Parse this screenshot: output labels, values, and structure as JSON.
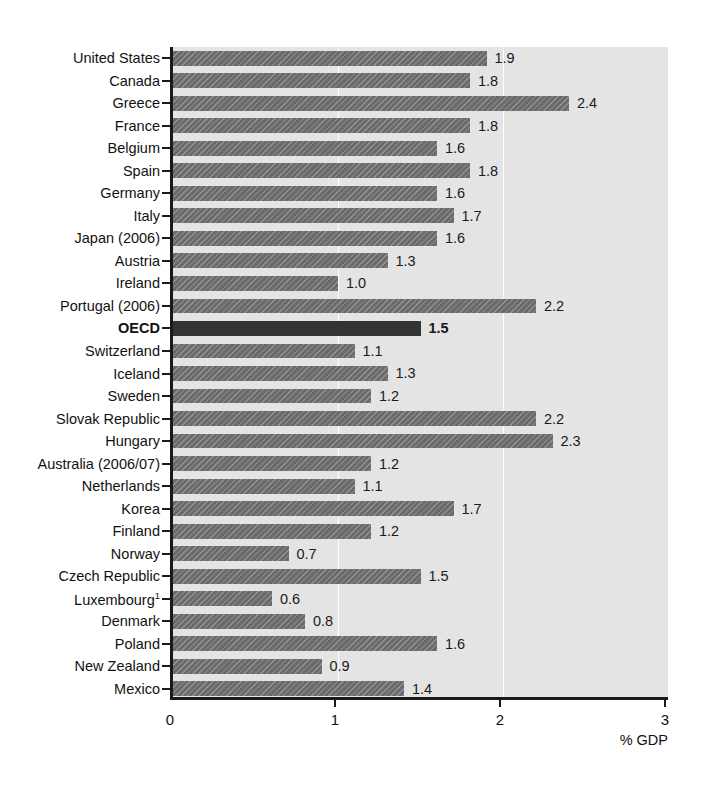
{
  "chart_data": {
    "type": "bar",
    "orientation": "horizontal",
    "title": "",
    "subtitle": "",
    "xlabel": "% GDP",
    "ylabel": "",
    "xlim": [
      0,
      3
    ],
    "xticks": [
      "0",
      "1",
      "2",
      "3"
    ],
    "xtick_values": [
      0,
      1,
      2,
      3
    ],
    "grid": "vertical gridlines at 1 and 2, white row separators",
    "legend": "none",
    "highlight_category": "OECD",
    "categories": [
      "United States",
      "Canada",
      "Greece",
      "France",
      "Belgium",
      "Spain",
      "Germany",
      "Italy",
      "Japan (2006)",
      "Austria",
      "Ireland",
      "Portugal (2006)",
      "OECD",
      "Switzerland",
      "Iceland",
      "Sweden",
      "Slovak Republic",
      "Hungary",
      "Australia (2006/07)",
      "Netherlands",
      "Korea",
      "Finland",
      "Norway",
      "Czech Republic",
      "Luxembourg",
      "Denmark",
      "Poland",
      "New Zealand",
      "Mexico"
    ],
    "values": [
      1.9,
      1.8,
      2.4,
      1.8,
      1.6,
      1.8,
      1.6,
      1.7,
      1.6,
      1.3,
      1.0,
      2.2,
      1.5,
      1.1,
      1.3,
      1.2,
      2.2,
      2.3,
      1.2,
      1.1,
      1.7,
      1.2,
      0.7,
      1.5,
      0.6,
      0.8,
      1.6,
      0.9,
      1.4
    ],
    "value_labels": [
      "1.9",
      "1.8",
      "2.4",
      "1.8",
      "1.6",
      "1.8",
      "1.6",
      "1.7",
      "1.6",
      "1.3",
      "1.0",
      "2.2",
      "1.5",
      "1.1",
      "1.3",
      "1.2",
      "2.2",
      "2.3",
      "1.2",
      "1.1",
      "1.7",
      "1.2",
      "0.7",
      "1.5",
      "0.6",
      "0.8",
      "1.6",
      "0.9",
      "1.4"
    ],
    "footnote_markers": {
      "Luxembourg": "1"
    },
    "colors": {
      "bar": "#6b6b6b",
      "bar_highlight": "#333333",
      "plot_background": "#e4e4e4",
      "gridline": "#ffffff",
      "axis": "#1a1a1a",
      "text": "#111111"
    }
  }
}
